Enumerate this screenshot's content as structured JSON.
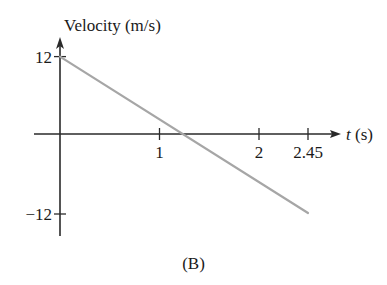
{
  "chart_data": {
    "type": "line",
    "title": "",
    "caption": "(B)",
    "xlabel": "t (s)",
    "xlabel_var": "t",
    "xlabel_unit": " (s)",
    "ylabel": "Velocity (m/s)",
    "x_ticks": [
      {
        "value": 1,
        "label": "1"
      },
      {
        "value": 2,
        "label": "2"
      },
      {
        "value": 2.45,
        "label": "2.45"
      }
    ],
    "y_ticks": [
      {
        "value": 12,
        "label": "12"
      },
      {
        "value": -12,
        "label": "−12"
      }
    ],
    "xlim": [
      -0.26,
      2.85
    ],
    "ylim": [
      -15.5,
      14.5
    ],
    "grid": false,
    "legend": null,
    "series": [
      {
        "name": "velocity",
        "color": "#a6a6a6",
        "x": [
          0,
          2.45
        ],
        "values": [
          12,
          -12
        ]
      }
    ]
  }
}
